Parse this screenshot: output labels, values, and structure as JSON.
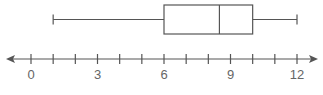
{
  "chart_data": {
    "type": "boxplot",
    "title": "",
    "xlabel": "",
    "ylabel": "",
    "xlim": [
      0,
      12
    ],
    "axis_arrows": "both",
    "grid": false,
    "tick_values": [
      0,
      1,
      2,
      3,
      4,
      5,
      6,
      7,
      8,
      9,
      10,
      11,
      12
    ],
    "tick_labels": [
      {
        "value": 0,
        "label": "0"
      },
      {
        "value": 3,
        "label": "3"
      },
      {
        "value": 6,
        "label": "6"
      },
      {
        "value": 9,
        "label": "9"
      },
      {
        "value": 12,
        "label": "12"
      }
    ],
    "summary": {
      "min": 1,
      "q1": 6,
      "median": 8.5,
      "q3": 10,
      "max": 12
    },
    "colors": {
      "stroke": "#555555",
      "label": "#666666"
    }
  }
}
